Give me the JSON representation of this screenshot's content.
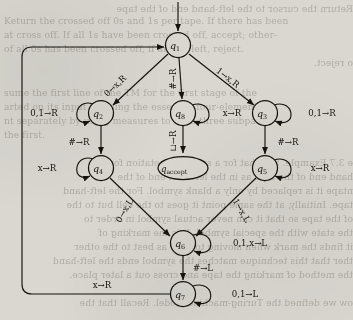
{
  "figure": {
    "type": "state-diagram",
    "states": [
      {
        "id": "q1",
        "label": "q",
        "sub": "1",
        "cx": 178,
        "cy": 45,
        "r": 12.5,
        "shape": "circle"
      },
      {
        "id": "q2",
        "label": "q",
        "sub": "2",
        "cx": 101,
        "cy": 113,
        "r": 12.5,
        "shape": "circle"
      },
      {
        "id": "q8",
        "label": "q",
        "sub": "8",
        "cx": 183,
        "cy": 113,
        "r": 12.5,
        "shape": "circle"
      },
      {
        "id": "q3",
        "label": "q",
        "sub": "3",
        "cx": 265,
        "cy": 113,
        "r": 12.5,
        "shape": "circle"
      },
      {
        "id": "q4",
        "label": "q",
        "sub": "4",
        "cx": 101,
        "cy": 168,
        "r": 12.5,
        "shape": "circle"
      },
      {
        "id": "qaccept",
        "label": "q",
        "sub": "accept",
        "cx": 183,
        "cy": 168,
        "rx": 25,
        "ry": 11.5,
        "shape": "ellipse"
      },
      {
        "id": "q5",
        "label": "q",
        "sub": "5",
        "cx": 265,
        "cy": 168,
        "r": 12.5,
        "shape": "circle"
      },
      {
        "id": "q6",
        "label": "q",
        "sub": "6",
        "cx": 183,
        "cy": 243,
        "r": 12.5,
        "shape": "circle"
      },
      {
        "id": "q7",
        "label": "q",
        "sub": "7",
        "cx": 183,
        "cy": 294,
        "r": 12.5,
        "shape": "circle"
      }
    ],
    "transitions": [
      {
        "id": "start",
        "from": "",
        "to": "q1",
        "label": ""
      },
      {
        "id": "q1-q2",
        "from": "q1",
        "to": "q2",
        "label": "0→x,R"
      },
      {
        "id": "q1-q8",
        "from": "q1",
        "to": "q8",
        "label": "#→R"
      },
      {
        "id": "q1-q3",
        "from": "q1",
        "to": "q3",
        "label": "1→x,R"
      },
      {
        "id": "q2-q2",
        "from": "q2",
        "to": "q2",
        "label": "0,1→R"
      },
      {
        "id": "q2-q4",
        "from": "q2",
        "to": "q4",
        "label": "#→R"
      },
      {
        "id": "q8-q8",
        "from": "q8",
        "to": "q8",
        "label": "x→R"
      },
      {
        "id": "q8-qacc",
        "from": "q8",
        "to": "qaccept",
        "label": "⊔→R"
      },
      {
        "id": "q3-q3",
        "from": "q3",
        "to": "q3",
        "label": "0,1→R"
      },
      {
        "id": "q3-q5",
        "from": "q3",
        "to": "q5",
        "label": "#→R"
      },
      {
        "id": "q4-q4",
        "from": "q4",
        "to": "q4",
        "label": "x→R"
      },
      {
        "id": "q4-q6",
        "from": "q4",
        "to": "q6",
        "label": "0→x,L"
      },
      {
        "id": "q5-q5",
        "from": "q5",
        "to": "q5",
        "label": "x→R"
      },
      {
        "id": "q5-q6",
        "from": "q5",
        "to": "q6",
        "label": "1→x,L"
      },
      {
        "id": "q6-q6",
        "from": "q6",
        "to": "q6",
        "label": "0,1,x→L"
      },
      {
        "id": "q6-q7",
        "from": "q6",
        "to": "q7",
        "label": "#→L"
      },
      {
        "id": "q7-q7",
        "from": "q7",
        "to": "q7",
        "label": "0,1→L"
      },
      {
        "id": "q7-q1",
        "from": "q7",
        "to": "q1",
        "label": "x→R"
      }
    ]
  },
  "background_text": {
    "lines": [
      "Return the cursor to the left-hand end of the tape",
      "Keturn the crossed off 0s and 1s per tape. If there has been",
      "at cross off. If all 1s have been crossed off, accept; other-",
      "of all 0s has been crossed off, if any 0s left, reject.",
      "o reject.",
      "",
      "sume the first line of the TM for the first stage of the",
      "arted on its input by using the essential four-element",
      "nt separately by using measures to form three subparts",
      "the first.",
      "",
      "e 3.7 Example. Say that for a subset of notation for the",
      "hand end of the tape as in the leftmost end of the",
      "ntape it is replaced by only a blank symbol. For the left-hand",
      "tape. Initially, at the same point it goes to the cell but to the",
      "of the tape so that it can never actual symbol in order to",
      "the state with the special symbol. It is the marking of",
      "it finds the mark when moving to goes as best to the other",
      "ther that this technique matches the symbol ends the left-hand",
      "the method of marking the tape and cross out a later place.",
      "ow we defined the Turing-machine model. Recall that the"
    ]
  }
}
